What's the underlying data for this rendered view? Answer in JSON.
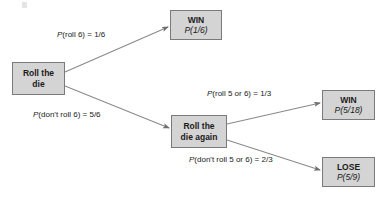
{
  "diagram": {
    "type": "probability-tree",
    "colors": {
      "node_fill": "#d4d4d4",
      "node_border": "#7a7a7a",
      "edge": "#8a8a8a",
      "text": "#1a1a1a",
      "background": "#ffffff"
    },
    "nodes": [
      {
        "id": "root",
        "name": "roll-the-die",
        "lines": [
          "Roll the",
          "die"
        ],
        "kind": "decision",
        "x": 12,
        "y": 62,
        "w": 53,
        "h": 33
      },
      {
        "id": "win1",
        "name": "win-first-roll",
        "lines": [
          "WIN",
          "P(1/6)"
        ],
        "kind": "outcome",
        "outcome": "WIN",
        "probability": "1/6",
        "x": 170,
        "y": 10,
        "w": 52,
        "h": 30
      },
      {
        "id": "again",
        "name": "roll-the-die-again",
        "lines": [
          "Roll the",
          "die again"
        ],
        "kind": "decision",
        "x": 171,
        "y": 115,
        "w": 56,
        "h": 33
      },
      {
        "id": "win2",
        "name": "win-second-roll",
        "lines": [
          "WIN",
          "P(5/18)"
        ],
        "kind": "outcome",
        "outcome": "WIN",
        "probability": "5/18",
        "x": 322,
        "y": 90,
        "w": 53,
        "h": 30
      },
      {
        "id": "lose",
        "name": "lose-outcome",
        "lines": [
          "LOSE",
          "P(5/9)"
        ],
        "kind": "outcome",
        "outcome": "LOSE",
        "probability": "5/9",
        "x": 322,
        "y": 157,
        "w": 53,
        "h": 30
      }
    ],
    "edges": [
      {
        "id": "e1",
        "name": "edge-roll-6",
        "from": "root",
        "to": "win1",
        "label_prefix": "P",
        "label_rest": "(roll 6) = 1/6",
        "probability": "1/6",
        "x1": 65,
        "y1": 72,
        "x2": 168,
        "y2": 27,
        "label_x": 57,
        "label_y": 30
      },
      {
        "id": "e2",
        "name": "edge-dont-roll-6",
        "from": "root",
        "to": "again",
        "label_prefix": "P",
        "label_rest": "(don't roll 6) = 5/6",
        "probability": "5/6",
        "x1": 65,
        "y1": 86,
        "x2": 169,
        "y2": 128,
        "label_x": 33,
        "label_y": 110
      },
      {
        "id": "e3",
        "name": "edge-roll-5-or-6",
        "from": "again",
        "to": "win2",
        "label_prefix": "P",
        "label_rest": "(roll 5 or 6) = 1/3",
        "probability": "1/3",
        "x1": 227,
        "y1": 124,
        "x2": 320,
        "y2": 103,
        "label_x": 207,
        "label_y": 89
      },
      {
        "id": "e4",
        "name": "edge-dont-roll-5-or-6",
        "from": "again",
        "to": "lose",
        "label_prefix": "P",
        "label_rest": "(don't roll 5 or 6) = 2/3",
        "probability": "2/3",
        "x1": 227,
        "y1": 140,
        "x2": 320,
        "y2": 170,
        "label_x": 189,
        "label_y": 155
      }
    ]
  }
}
